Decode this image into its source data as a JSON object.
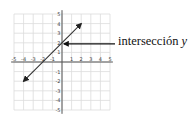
{
  "diagram": {
    "type": "coordinate-plane-line",
    "x_range": [
      -5,
      5
    ],
    "y_range": [
      -5,
      5
    ],
    "x_tick_labels": [
      "-5",
      "-4",
      "-3",
      "-2",
      "-1",
      "1",
      "2",
      "3",
      "4",
      "5"
    ],
    "y_tick_labels": [
      "5",
      "4",
      "3",
      "2",
      "1",
      "-1",
      "-2",
      "-3",
      "-4",
      "-5"
    ],
    "line": {
      "equation": "y = x + 2",
      "from": [
        -4,
        -2
      ],
      "to": [
        2,
        4
      ],
      "arrows": "both"
    },
    "intercept_point": [
      0,
      2
    ],
    "annotation": {
      "text": "intersección",
      "var": "y"
    },
    "colors": {
      "grid": "#d9d9d9",
      "axis": "#555555",
      "line": "#333333",
      "arrow": "#111111"
    }
  }
}
